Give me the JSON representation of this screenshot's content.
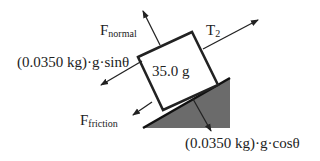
{
  "diagram": {
    "mass_label": "35.0 g",
    "forces": {
      "normal": {
        "symbol": "F",
        "subscript": "normal"
      },
      "tension": {
        "symbol": "T",
        "subscript": "2"
      },
      "parallel_gravity": {
        "text": "(0.0350 kg)·g·sinθ"
      },
      "friction": {
        "symbol": "F",
        "subscript": "friction"
      },
      "perpendicular_gravity": {
        "text": "(0.0350 kg)·g·cosθ"
      }
    },
    "colors": {
      "line": "#222222",
      "incline_fill": "#6b6b6b",
      "block_fill": "#ffffff"
    }
  }
}
